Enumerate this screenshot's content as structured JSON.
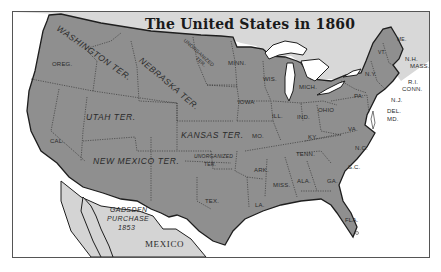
{
  "map": {
    "title": "The United States in 1860",
    "colors": {
      "states": "#8f8f8f",
      "foreign_land": "#d4d4d4",
      "canada": "#d8d8d8",
      "water": "#ffffff",
      "borders": "#1e1e1e"
    },
    "territories": {
      "washington": "WASHINGTON TER.",
      "nebraska_1": "NEBRASKA",
      "nebraska_2": "TER.",
      "unorganized_north_1": "UNORGANIZED",
      "unorganized_north_2": "TER.",
      "utah": "UTAH   TER.",
      "kansas": "KANSAS TER.",
      "new_mexico": "NEW MEXICO TER.",
      "unorganized_south_1": "UNORGANIZED",
      "unorganized_south_2": "TER."
    },
    "states": {
      "oregon": "OREG.",
      "california": "CAL.",
      "minnesota": "MINN.",
      "wisconsin": "WIS.",
      "michigan": "MICH.",
      "iowa": "IOWA",
      "illinois": "ILL.",
      "indiana": "IND.",
      "ohio": "OHIO",
      "missouri": "MO.",
      "kentucky": "KY.",
      "tennessee": "TENN.",
      "arkansas": "ARK.",
      "texas": "TEX.",
      "louisiana": "LA.",
      "mississippi": "MISS.",
      "alabama": "ALA.",
      "georgia": "GA.",
      "florida": "FLA.",
      "south_carolina": "S.C.",
      "north_carolina": "N.C.",
      "virginia": "VA.",
      "pennsylvania": "PA.",
      "new_york": "N.Y.",
      "vermont": "VT.",
      "maine": "ME.",
      "new_hampshire": "N.H.",
      "massachusetts": "MASS.",
      "rhode_island": "R.I.",
      "connecticut": "CONN.",
      "new_jersey": "N.J.",
      "delaware": "DEL.",
      "maryland": "MD."
    },
    "other": {
      "gadsden_1": "GADSDEN",
      "gadsden_2": "PURCHASE",
      "gadsden_3": "1853",
      "mexico": "MEXICO"
    }
  }
}
